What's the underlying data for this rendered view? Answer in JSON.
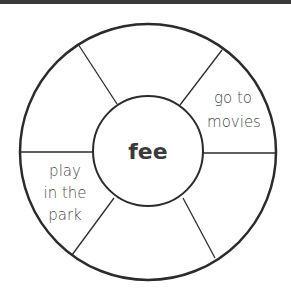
{
  "diagram": {
    "type": "word-wheel",
    "center_word": "fee",
    "segments": [
      {
        "position": "top",
        "lines": []
      },
      {
        "position": "upper-right",
        "lines": [
          "go to",
          "movies"
        ]
      },
      {
        "position": "lower-right",
        "lines": []
      },
      {
        "position": "bottom",
        "lines": []
      },
      {
        "position": "lower-left",
        "lines": []
      },
      {
        "position": "upper-left",
        "lines": [
          "play",
          "in the",
          "park"
        ]
      }
    ],
    "colors": {
      "stroke": "#2b2b2b",
      "text": "#4a4a4a",
      "top_bar": "#3a3a3a"
    }
  }
}
